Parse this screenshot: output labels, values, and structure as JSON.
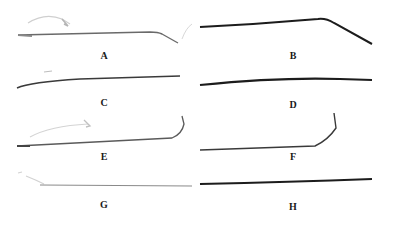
{
  "figure": {
    "panels": [
      {
        "id": "A",
        "label": "A"
      },
      {
        "id": "B",
        "label": "B"
      },
      {
        "id": "C",
        "label": "C"
      },
      {
        "id": "D",
        "label": "D"
      },
      {
        "id": "E",
        "label": "E"
      },
      {
        "id": "F",
        "label": "F"
      },
      {
        "id": "G",
        "label": "G"
      },
      {
        "id": "H",
        "label": "H"
      }
    ],
    "colors": {
      "background": "#ffffff",
      "fiber_dark": "#1c1c1c",
      "fiber_mid": "#5a5a5a",
      "fiber_faint": "#c8c8c8"
    }
  }
}
